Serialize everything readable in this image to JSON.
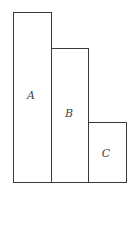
{
  "diagram": {
    "blocks": [
      {
        "label": "A",
        "x": 13,
        "y": 12,
        "width": 39,
        "height": 171,
        "label_x": 31,
        "label_y": 95
      },
      {
        "label": "B",
        "x": 51,
        "y": 48,
        "width": 38,
        "height": 135,
        "label_x": 69,
        "label_y": 113
      },
      {
        "label": "C",
        "x": 88,
        "y": 122,
        "width": 39,
        "height": 61,
        "label_x": 106,
        "label_y": 153
      }
    ]
  }
}
